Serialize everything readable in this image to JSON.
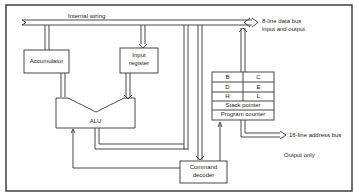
{
  "diagram": {
    "bus_label": "Internal wiring",
    "data_bus": {
      "line1": "8-line data bus",
      "line2": "input and output"
    },
    "accumulator": "Accumulator",
    "input_register": {
      "line1": "Input",
      "line2": "register"
    },
    "alu": "ALU",
    "registers": [
      [
        "B",
        "C"
      ],
      [
        "D",
        "E"
      ],
      [
        "H",
        "L"
      ]
    ],
    "stack_pointer": "Stack pointer",
    "program_counter": "Program counter",
    "address_bus": "16-line address bus",
    "output_only": "Output only",
    "command_decoder": {
      "line1": "Command",
      "line2": "decoder"
    }
  }
}
